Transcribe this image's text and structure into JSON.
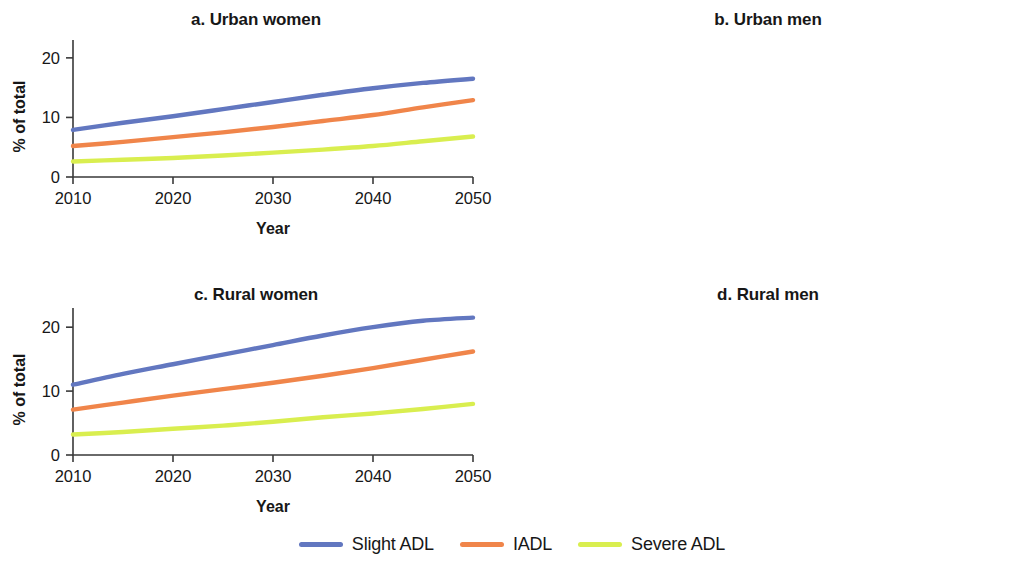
{
  "figure": {
    "background": "#ffffff",
    "axis_color": "#3a3a3a"
  },
  "legend": {
    "position": "bottom-center",
    "items": [
      {
        "label": "Slight ADL",
        "color": "#6277c0"
      },
      {
        "label": "IADL",
        "color": "#f0854a"
      },
      {
        "label": "Severe ADL",
        "color": "#d9ee4f"
      }
    ]
  },
  "chart_data": [
    {
      "type": "line",
      "title": "a. Urban women",
      "xlabel": "Year",
      "ylabel": "% of total",
      "x": [
        2010,
        2015,
        2020,
        2025,
        2030,
        2035,
        2040,
        2045,
        2050
      ],
      "xlim": [
        2010,
        2050
      ],
      "ylim": [
        0,
        23
      ],
      "xticks": [
        2010,
        2020,
        2030,
        2040,
        2050
      ],
      "yticks": [
        0,
        10,
        20
      ],
      "grid": false,
      "series": [
        {
          "name": "Slight ADL",
          "color": "#6277c0",
          "values": [
            7.9,
            9.1,
            10.2,
            11.4,
            12.6,
            13.8,
            14.9,
            15.8,
            16.5
          ]
        },
        {
          "name": "IADL",
          "color": "#f0854a",
          "values": [
            5.2,
            5.9,
            6.7,
            7.5,
            8.4,
            9.4,
            10.4,
            11.7,
            12.9
          ]
        },
        {
          "name": "Severe ADL",
          "color": "#d9ee4f",
          "values": [
            2.6,
            2.9,
            3.2,
            3.6,
            4.1,
            4.6,
            5.2,
            6.0,
            6.8
          ]
        }
      ]
    },
    {
      "type": "line",
      "title": "b. Urban men",
      "xlabel": "Year",
      "ylabel": "% of total",
      "x": [
        2010,
        2015,
        2020,
        2025,
        2030,
        2035,
        2040,
        2045,
        2050
      ],
      "xlim": [
        2010,
        2050
      ],
      "ylim": [
        0,
        23
      ],
      "xticks": [
        2010,
        2020,
        2030,
        2040,
        2050
      ],
      "yticks": [
        0,
        10,
        20
      ],
      "grid": false,
      "series": [
        {
          "name": "Slight ADL",
          "color": "#6277c0",
          "values": [
            4.0,
            4.4,
            4.9,
            5.4,
            6.0,
            6.7,
            7.3,
            7.6,
            7.9
          ]
        },
        {
          "name": "IADL",
          "color": "#f0854a",
          "values": [
            4.1,
            4.6,
            5.1,
            5.7,
            6.3,
            7.1,
            7.9,
            8.6,
            9.3
          ]
        },
        {
          "name": "Severe ADL",
          "color": "#d9ee4f",
          "values": [
            2.2,
            2.4,
            2.7,
            3.0,
            3.4,
            3.9,
            4.5,
            5.1,
            5.6
          ]
        }
      ]
    },
    {
      "type": "line",
      "title": "c. Rural women",
      "xlabel": "Year",
      "ylabel": "% of total",
      "x": [
        2010,
        2015,
        2020,
        2025,
        2030,
        2035,
        2040,
        2045,
        2050
      ],
      "xlim": [
        2010,
        2050
      ],
      "ylim": [
        0,
        23
      ],
      "xticks": [
        2010,
        2020,
        2030,
        2040,
        2050
      ],
      "yticks": [
        0,
        10,
        20
      ],
      "grid": false,
      "series": [
        {
          "name": "Slight ADL",
          "color": "#6277c0",
          "values": [
            11.0,
            12.7,
            14.2,
            15.7,
            17.2,
            18.7,
            20.0,
            21.0,
            21.5
          ]
        },
        {
          "name": "IADL",
          "color": "#f0854a",
          "values": [
            7.1,
            8.2,
            9.3,
            10.3,
            11.3,
            12.4,
            13.6,
            14.9,
            16.2
          ]
        },
        {
          "name": "Severe ADL",
          "color": "#d9ee4f",
          "values": [
            3.2,
            3.6,
            4.1,
            4.6,
            5.2,
            5.9,
            6.5,
            7.2,
            8.0
          ]
        }
      ]
    },
    {
      "type": "line",
      "title": "d. Rural men",
      "xlabel": "Year",
      "ylabel": "% of total",
      "x": [
        2010,
        2015,
        2020,
        2025,
        2030,
        2035,
        2040,
        2045,
        2050
      ],
      "xlim": [
        2010,
        2050
      ],
      "ylim": [
        0,
        23
      ],
      "xticks": [
        2010,
        2020,
        2030,
        2040,
        2050
      ],
      "yticks": [
        0,
        10,
        20
      ],
      "grid": false,
      "series": [
        {
          "name": "Slight ADL",
          "color": "#6277c0",
          "values": [
            6.4,
            7.3,
            8.3,
            9.2,
            10.1,
            11.0,
            11.9,
            12.6,
            13.2
          ]
        },
        {
          "name": "IADL",
          "color": "#f0854a",
          "values": [
            5.0,
            5.7,
            6.4,
            7.1,
            7.9,
            8.7,
            9.5,
            10.3,
            11.1
          ]
        },
        {
          "name": "Severe ADL",
          "color": "#d9ee4f",
          "values": [
            2.3,
            2.6,
            2.9,
            3.2,
            3.6,
            4.1,
            4.6,
            5.1,
            5.5
          ]
        }
      ]
    }
  ]
}
